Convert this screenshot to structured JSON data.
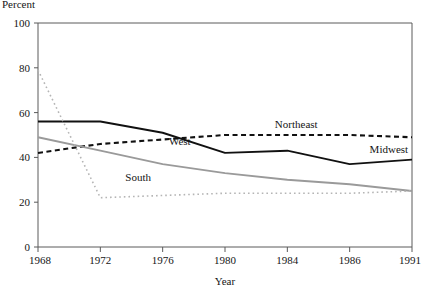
{
  "figure": {
    "top_label": "Percent",
    "xlabel": "Year",
    "ylabel": ""
  },
  "axes": {
    "y_ticks": [
      "0",
      "20",
      "40",
      "60",
      "80",
      "100"
    ],
    "x_ticks": [
      "1968",
      "1972",
      "1976",
      "1980",
      "1984",
      "1986",
      "1991"
    ]
  },
  "series_labels": {
    "northeast": "Northeast",
    "midwest": "Midwest",
    "west": "West",
    "south": "South"
  },
  "colors": {
    "northeast": "#111111",
    "midwest": "#111111",
    "west": "#9a9a9a",
    "south": "#b5b5b5",
    "axis": "#5a5a5a",
    "text": "#151515",
    "background": "#ffffff"
  },
  "chart_data": {
    "type": "line",
    "title": "",
    "subtitle": "",
    "xlabel": "Year",
    "ylabel": "Percent",
    "xlim": [
      1968,
      1991
    ],
    "ylim": [
      0,
      100
    ],
    "grid": false,
    "legend": "inline-annotations",
    "x": [
      1968,
      1972,
      1976,
      1980,
      1984,
      1986,
      1991
    ],
    "x_tick_labels": [
      "1968",
      "1972",
      "1976",
      "1980",
      "1984",
      "1986",
      "1991"
    ],
    "y_ticks": [
      0,
      20,
      40,
      60,
      80,
      100
    ],
    "series": [
      {
        "name": "Northeast",
        "style": "dashed",
        "color": "#111111",
        "values": [
          42,
          46,
          48,
          50,
          50,
          50,
          49
        ]
      },
      {
        "name": "Midwest",
        "style": "solid",
        "color": "#111111",
        "values": [
          56,
          56,
          51,
          42,
          43,
          37,
          39
        ]
      },
      {
        "name": "West",
        "style": "solid",
        "color": "#9a9a9a",
        "values": [
          49,
          43,
          37,
          33,
          30,
          28,
          25
        ]
      },
      {
        "name": "South",
        "style": "dotted",
        "color": "#b5b5b5",
        "values": [
          79,
          22,
          23,
          24,
          24,
          24,
          25
        ]
      }
    ],
    "annotations": [
      {
        "text": "Northeast",
        "x": 1983.2,
        "y": 53
      },
      {
        "text": "Midwest",
        "x": 1987.6,
        "y": 42
      },
      {
        "text": "West",
        "x": 1976.4,
        "y": 45.5
      },
      {
        "text": "South",
        "x": 1973.6,
        "y": 29.5
      }
    ]
  }
}
